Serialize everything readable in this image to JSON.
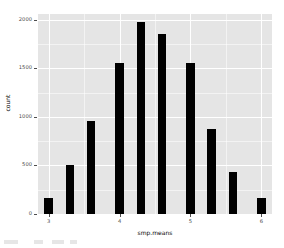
{
  "chart_data": {
    "type": "bar",
    "title": "",
    "subtitle": "",
    "xlabel": "smp.means",
    "ylabel": "count",
    "x": [
      3.0,
      3.3,
      3.6,
      4.0,
      4.3,
      4.6,
      5.0,
      5.3,
      5.6,
      6.0
    ],
    "categories": [
      "3.0",
      "3.3",
      "3.6",
      "4.0",
      "4.3",
      "4.6",
      "5.0",
      "5.3",
      "5.6",
      "6.0"
    ],
    "values": [
      170,
      510,
      960,
      1560,
      1980,
      1850,
      1560,
      880,
      430,
      160
    ],
    "series": [
      {
        "name": "count",
        "values": [
          170,
          510,
          960,
          1560,
          1980,
          1850,
          1560,
          880,
          430,
          160
        ]
      }
    ],
    "bar_color": "#000000",
    "panel_background": "#e5e5e5",
    "grid_color": "#ffffff",
    "grid": true,
    "legend": false,
    "legend_position": "none",
    "xlim": [
      2.85,
      6.15
    ],
    "ylim": [
      0,
      2060
    ],
    "x_ticks": [
      3,
      4,
      5,
      6
    ],
    "x_tick_labels": [
      "3",
      "4",
      "5",
      "6"
    ],
    "x_minor_ticks": [
      3.5,
      4.5,
      5.5
    ],
    "y_ticks": [
      0,
      500,
      1000,
      1500,
      2000
    ],
    "y_tick_labels": [
      "0",
      "500",
      "1000",
      "1500",
      "2000"
    ],
    "y_minor_ticks": [
      250,
      750,
      1250,
      1750
    ]
  },
  "figure": {
    "axis_text_color": "#4d4d4d",
    "axis_title_color": "#000000"
  }
}
